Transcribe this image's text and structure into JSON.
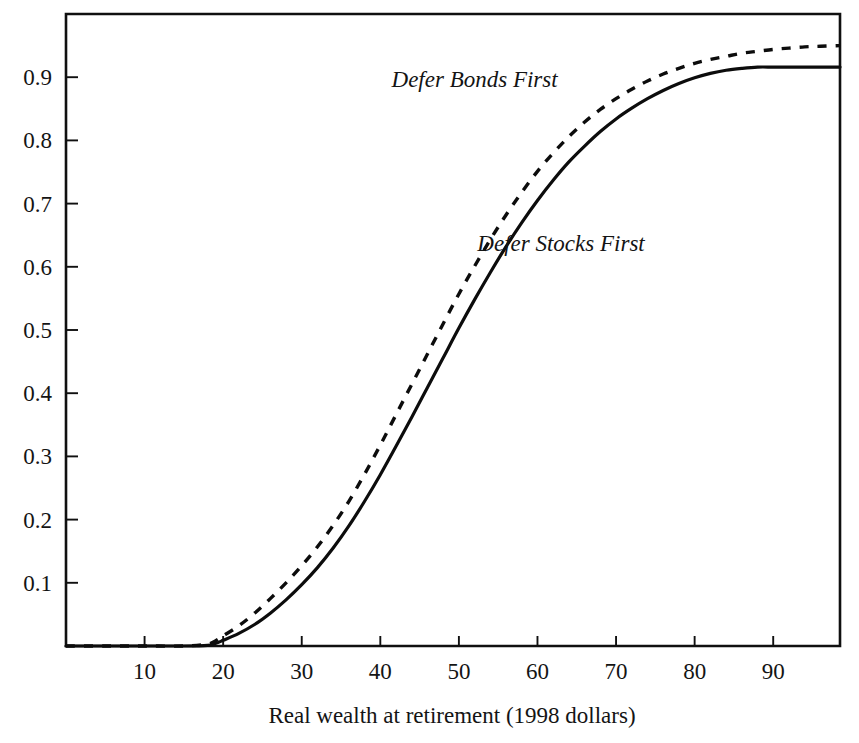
{
  "chart_data": {
    "type": "line",
    "title": "",
    "subtitle": "",
    "xlabel": "Real wealth at retirement (1998 dollars)",
    "ylabel": "",
    "xlim": [
      0,
      98.5
    ],
    "ylim": [
      0,
      1.0
    ],
    "grid": false,
    "legend_position": "inline-annotations",
    "xticks": [
      10,
      20,
      30,
      40,
      50,
      60,
      70,
      80,
      90
    ],
    "xtick_labels": [
      "10",
      "20",
      "30",
      "40",
      "50",
      "60",
      "70",
      "80",
      "90"
    ],
    "yticks": [
      0.1,
      0.2,
      0.3,
      0.4,
      0.5,
      0.6,
      0.7,
      0.8,
      0.9
    ],
    "ytick_labels": [
      "0.1",
      "0.2",
      "0.3",
      "0.4",
      "0.5",
      "0.6",
      "0.7",
      "0.8",
      "0.9"
    ],
    "x": [
      0,
      5,
      10,
      15,
      18,
      19,
      20,
      22,
      24,
      26,
      28,
      30,
      32,
      34,
      36,
      38,
      40,
      42,
      44,
      46,
      48,
      50,
      52,
      54,
      56,
      58,
      60,
      62,
      64,
      66,
      68,
      70,
      72,
      74,
      76,
      78,
      80,
      82,
      84,
      86,
      88,
      90,
      92,
      94,
      96,
      98.5
    ],
    "series": [
      {
        "name": "Defer Bonds First",
        "style": "dashed",
        "color": "#0c0c0c",
        "label_x": 52,
        "label_y": 0.885,
        "values": [
          0,
          0,
          0,
          0,
          0.003,
          0.008,
          0.016,
          0.032,
          0.052,
          0.075,
          0.1,
          0.127,
          0.157,
          0.191,
          0.229,
          0.272,
          0.318,
          0.366,
          0.414,
          0.462,
          0.51,
          0.557,
          0.601,
          0.643,
          0.682,
          0.718,
          0.751,
          0.78,
          0.806,
          0.829,
          0.849,
          0.866,
          0.881,
          0.894,
          0.905,
          0.914,
          0.922,
          0.928,
          0.933,
          0.938,
          0.941,
          0.944,
          0.946,
          0.948,
          0.949,
          0.95
        ]
      },
      {
        "name": "Defer Stocks First",
        "style": "solid",
        "color": "#0c0c0c",
        "label_x": 63,
        "label_y": 0.625,
        "values": [
          0,
          0,
          0,
          0,
          0.001,
          0.004,
          0.009,
          0.02,
          0.034,
          0.052,
          0.073,
          0.097,
          0.124,
          0.155,
          0.19,
          0.229,
          0.271,
          0.316,
          0.362,
          0.409,
          0.456,
          0.503,
          0.548,
          0.591,
          0.632,
          0.67,
          0.705,
          0.737,
          0.766,
          0.791,
          0.814,
          0.834,
          0.851,
          0.866,
          0.879,
          0.89,
          0.899,
          0.906,
          0.911,
          0.914,
          0.916,
          0.916,
          0.916,
          0.916,
          0.916,
          0.916
        ]
      }
    ]
  },
  "figure": {
    "background_color": "#ffffff",
    "axis_color": "#101010"
  }
}
